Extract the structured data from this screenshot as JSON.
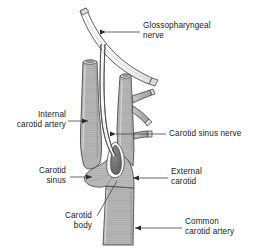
{
  "figure": {
    "type": "anatomical-diagram",
    "width": 259,
    "height": 251,
    "background_color": "#ffffff",
    "outline_color": "#4d4d4d",
    "vessel_fill_color": "#b3b3b3",
    "vessel_fill_light": "#cccccc",
    "carotid_body_color": "#6b6b6b",
    "nerve_fill_color": "#f2f2f2",
    "leader_line_color": "#4d4d4d",
    "text_color": "#1a1a1a"
  },
  "labels": {
    "glossopharyngeal_nerve": "Glossopharyngeal\nnerve",
    "internal_carotid_artery": "Internal\ncarotid artery",
    "carotid_sinus_nerve": "Carotid sinus nerve",
    "carotid_sinus": "Carotid\nsinus",
    "external_carotid": "External\ncarotid",
    "carotid_body": "Carotid\nbody",
    "common_carotid_artery": "Common\ncarotid artery"
  },
  "structures": [
    {
      "name": "glossopharyngeal-nerve",
      "label_key": "glossopharyngeal_nerve"
    },
    {
      "name": "internal-carotid-artery",
      "label_key": "internal_carotid_artery"
    },
    {
      "name": "carotid-sinus-nerve",
      "label_key": "carotid_sinus_nerve"
    },
    {
      "name": "carotid-sinus",
      "label_key": "carotid_sinus"
    },
    {
      "name": "external-carotid",
      "label_key": "external_carotid"
    },
    {
      "name": "carotid-body",
      "label_key": "carotid_body"
    },
    {
      "name": "common-carotid-artery",
      "label_key": "common_carotid_artery"
    }
  ]
}
